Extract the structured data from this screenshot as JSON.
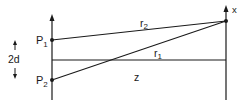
{
  "diagram": {
    "labels": {
      "p1": "P",
      "p1_sub": "1",
      "p2": "P",
      "p2_sub": "2",
      "separation": "2d",
      "r1": "r",
      "r1_sub": "1",
      "r2": "r",
      "r2_sub": "2",
      "z": "z",
      "x_axis": "x"
    },
    "colors": {
      "stroke": "#1a1a1a",
      "background": "#ffffff"
    }
  }
}
